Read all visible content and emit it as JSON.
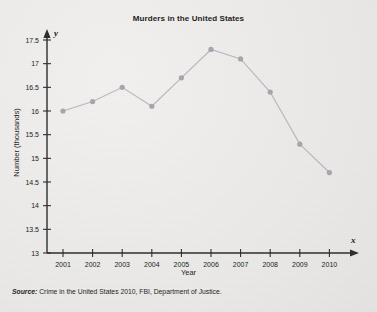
{
  "chart_data": {
    "type": "line",
    "title": "Murders in the United States",
    "xlabel": "Year",
    "ylabel": "Number (thousands)",
    "x_axis_variable": "x",
    "y_axis_variable": "y",
    "categories": [
      "2001",
      "2002",
      "2003",
      "2004",
      "2005",
      "2006",
      "2007",
      "2008",
      "2009",
      "2010"
    ],
    "values": [
      16.0,
      16.2,
      16.5,
      16.1,
      16.7,
      17.3,
      17.1,
      16.4,
      15.3,
      14.7
    ],
    "y_ticks": [
      "13",
      "13.5",
      "14",
      "14.5",
      "15",
      "15.5",
      "16",
      "16.5",
      "17",
      "17.5"
    ],
    "y_tick_values": [
      13,
      13.5,
      14,
      14.5,
      15,
      15.5,
      16,
      16.5,
      17,
      17.5
    ],
    "ylim": [
      13,
      17.5
    ],
    "grid": false,
    "legend": "none",
    "marker": "circle",
    "line_color": "#b9b7bd",
    "marker_color": "#a6a4ac",
    "axis_color": "#2e2e2e"
  },
  "source": {
    "label": "Source:",
    "text": "Crime in the United States 2010, FBI, Department of Justice."
  }
}
